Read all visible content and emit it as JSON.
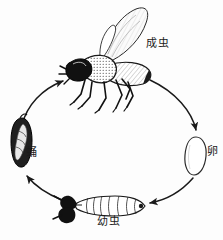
{
  "figure": {
    "type": "insect-life-cycle-diagram",
    "direction": "clockwise",
    "background_color": "#fdfdfd",
    "ink_color": "#1a1a1a"
  },
  "stages": [
    {
      "id": "adult",
      "label": "成虫",
      "icon": "adult-fly-icon",
      "position": "top"
    },
    {
      "id": "egg",
      "label": "卵",
      "icon": "egg-icon",
      "position": "right"
    },
    {
      "id": "larva",
      "label": "幼虫",
      "icon": "larva-maggot-icon",
      "position": "bottom"
    },
    {
      "id": "pupa",
      "label": "蛹",
      "icon": "pupa-puparium-icon",
      "position": "left"
    }
  ],
  "arrows": [
    {
      "id": "adult-to-egg",
      "from": "adult",
      "to": "egg",
      "icon": "curved-arrow-icon"
    },
    {
      "id": "egg-to-larva",
      "from": "egg",
      "to": "larva",
      "icon": "curved-arrow-icon"
    },
    {
      "id": "larva-to-pupa",
      "from": "larva",
      "to": "pupa",
      "icon": "curved-arrow-icon"
    },
    {
      "id": "pupa-to-adult",
      "from": "pupa",
      "to": "adult",
      "icon": "curved-arrow-icon"
    }
  ]
}
